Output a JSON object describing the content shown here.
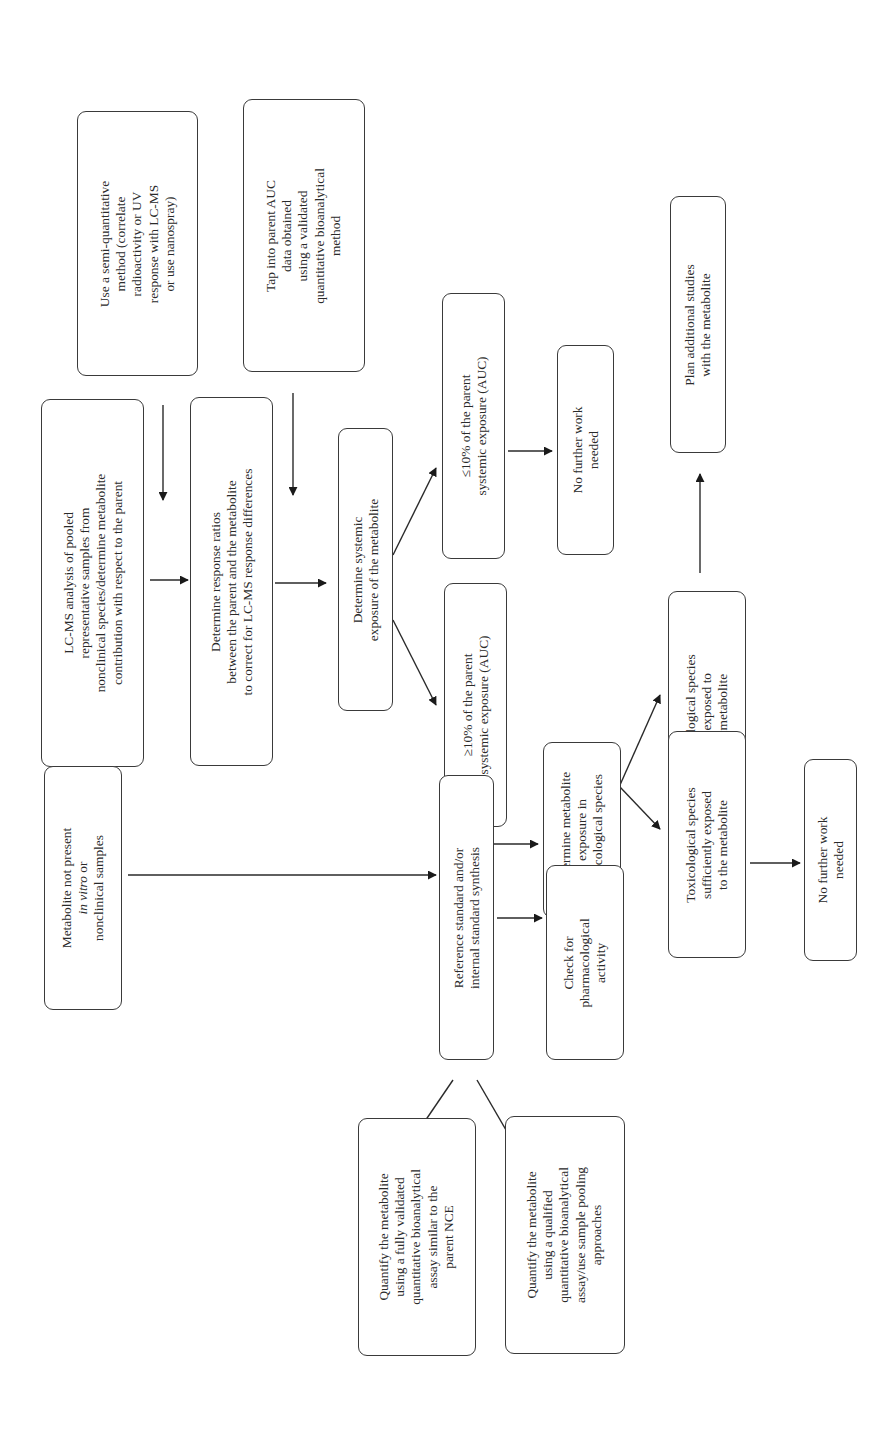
{
  "diagram": {
    "orientation": "rotated-90-ccw",
    "nodes": {
      "lcms": {
        "lines": [
          "LC-MS analysis of pooled",
          "representative samples from",
          "nonclinical species/determine metabolite",
          "contribution with respect to the parent"
        ]
      },
      "semi_quant": {
        "lines": [
          "Use a semi-quantitative",
          "method (correlate",
          "radioactivity or UV",
          "response with LC-MS",
          "or use nanospray)"
        ]
      },
      "tap_auc": {
        "lines": [
          "Tap into parent AUC",
          "data obtained",
          "using a validated",
          "quantitative bioanalytical",
          "method"
        ]
      },
      "response_ratios": {
        "lines": [
          "Determine response ratios",
          "between the parent and the metabolite",
          "to correct for LC-MS response differences"
        ]
      },
      "systemic_exposure": {
        "lines": [
          "Determine systemic",
          "exposure of the metabolite"
        ]
      },
      "le10": {
        "lines": [
          "≤10% of the parent",
          "systemic exposure (AUC)"
        ]
      },
      "ge10": {
        "lines": [
          "≥10% of the parent",
          "systemic exposure (AUC)"
        ]
      },
      "no_further_1": {
        "lines": [
          "No further work",
          "needed"
        ]
      },
      "plan_studies": {
        "lines": [
          "Plan additional studies",
          "with the metabolite"
        ]
      },
      "tox_not_exposed": {
        "lines": [
          "Toxicological species",
          "not exposed to",
          "the metabolite"
        ]
      },
      "det_tox_exposure": {
        "lines": [
          "Determine metabolite",
          "exposure in",
          "toxicological species"
        ]
      },
      "tox_sufficient": {
        "lines": [
          "Toxicological species",
          "sufficiently exposed",
          "to the metabolite"
        ]
      },
      "no_further_2": {
        "lines": [
          "No further work",
          "needed"
        ]
      },
      "not_present": {
        "line1": "Metabolite not present",
        "line2_italic": "in vitro",
        "line2_rest": " or",
        "line3": "nonclinical samples"
      },
      "reference_std": {
        "lines": [
          "Reference standard and/or",
          "internal standard synthesis"
        ]
      },
      "check_pharm": {
        "lines": [
          "Check for",
          "pharmacological",
          "activity"
        ]
      },
      "quantify_full": {
        "lines": [
          "Quantify the metabolite",
          "using a fully validated",
          "quantitative bioanalytical",
          "assay similar to the",
          "parent NCE"
        ]
      },
      "quantify_qual": {
        "lines": [
          "Quantify the metabolite",
          "using a qualified",
          "quantitative bioanalytical",
          "assay/use sample pooling",
          "approaches"
        ]
      }
    },
    "edges": [
      [
        "semi_quant",
        "response_ratios"
      ],
      [
        "lcms",
        "response_ratios"
      ],
      [
        "tap_auc",
        "systemic_exposure"
      ],
      [
        "response_ratios",
        "systemic_exposure"
      ],
      [
        "systemic_exposure",
        "le10"
      ],
      [
        "systemic_exposure",
        "ge10"
      ],
      [
        "le10",
        "no_further_1"
      ],
      [
        "ge10",
        "reference_std"
      ],
      [
        "ge10",
        "det_tox_exposure"
      ],
      [
        "det_tox_exposure",
        "tox_not_exposed"
      ],
      [
        "det_tox_exposure",
        "tox_sufficient"
      ],
      [
        "tox_not_exposed",
        "plan_studies"
      ],
      [
        "tox_sufficient",
        "no_further_2"
      ],
      [
        "lcms",
        "not_present"
      ],
      [
        "not_present",
        "reference_std"
      ],
      [
        "reference_std",
        "check_pharm"
      ],
      [
        "reference_std",
        "quantify_full"
      ],
      [
        "reference_std",
        "quantify_qual"
      ]
    ]
  }
}
